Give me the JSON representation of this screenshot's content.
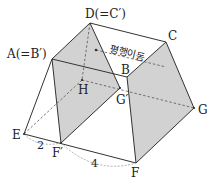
{
  "diagram": {
    "type": "3d-solid-translation",
    "colors": {
      "shade": "#d2d2d2",
      "line": "#333333",
      "dashed": "#555555",
      "measure": "#999999"
    },
    "points": {
      "D": {
        "label": "D(=C′)",
        "x": 90,
        "y": 23
      },
      "C": {
        "label": "C",
        "x": 166,
        "y": 42
      },
      "A": {
        "label": "A(=B′)",
        "x": 52,
        "y": 59
      },
      "B": {
        "label": "B",
        "x": 127,
        "y": 77
      },
      "H": {
        "label": "H",
        "x": 82,
        "y": 80
      },
      "Gp": {
        "label": "G′",
        "x": 120,
        "y": 88
      },
      "G": {
        "label": "G",
        "x": 194,
        "y": 108
      },
      "E": {
        "label": "E",
        "x": 24,
        "y": 134
      },
      "Fp": {
        "label": "F′",
        "x": 61,
        "y": 143
      },
      "F": {
        "label": "F",
        "x": 136,
        "y": 163
      }
    },
    "annotation": "평행이동",
    "lengths": {
      "EFp": "2",
      "FpF": "4"
    }
  }
}
